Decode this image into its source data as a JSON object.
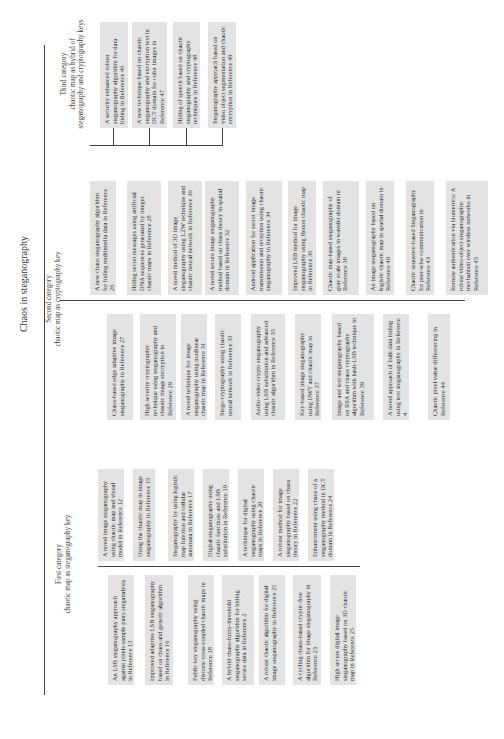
{
  "title": "Chaos in steganography",
  "categories": [
    {
      "label_line1": "First category",
      "label_line2": "chaotic map as steganography key",
      "top_boxes": [
        "A novel image steganography using chaotic map and visual model in Reference 12",
        "Using the chaotic map in image steganography in Reference 15",
        "Steganography by using logistic map function and cellular automata in Reference 17",
        "Digital steganography using chaotic functions and LSB substitution in Reference 19",
        "A technique for digital steganography using chaotic maps in Reference 20",
        "A robust method for image steganography based on chaos theory in Reference 22",
        "Enhancement using chaos of a steganography method in DCT domain in Reference 24"
      ],
      "bottom_boxes": [
        "An LSB steganography approach against pixels sample pairs steganalysis in Reference 13",
        "Improved adaptive LSB steganography based on chaos and genetic algorithm in Reference 16",
        "Public key steganography using discrete cross-coupled chaotic maps in Reference 18",
        "A hybrid chaos-fuzzy-threshold steganography algorithm for hiding secure data in Reference 2",
        "A robust chaotic algorithm for digital image steganography in Reference 21",
        "A cycling chaos-based cryptic-free algorithm for image steganography in Reference 23",
        "High secure digital image steganography based on 3D chaotic map in Reference 25"
      ]
    },
    {
      "label_line1": "Second category",
      "label_line2": "chaotic map as cryptography key",
      "top_boxes": [
        "A new chaos steganography algorithm for hiding multimedia data in Reference 26",
        "Hiding secret messages using artificial DNA sequences generated by integer chaotic maps in Reference 28",
        "A novel method of 3D image steganography using LZW technique and chaotic neural network in Reference 30",
        "A novel secure image steganography method based on chaos theory in spatial domain in Reference 32",
        "Android application for secret image transmission and reception using chaotic steganography in Reference 34",
        "Improved LSB method for image steganography using Henon chaotic map in Reference 36",
        "Chaotic map-based steganography of gray scale images in wavelet domain in Reference 38",
        "An image steganography based on logistic chaotic map in spatial domain in Reference 40",
        "Chaotic sequence-based Steganography for peer-wise communication in Reference 43",
        "Remote authentication via biometrics: A robust video-object steganographic mechanism over wireless networks in Reference 45"
      ],
      "bottom_boxes": [
        "Chaos-based edge adaptive image steganography in Reference 27",
        "High security cryptographic technique using steganography and chaotic image encryption in Reference 29",
        "A novel technique for image steganography using nonlinear chaotic map in Reference 31",
        "Stego-cryptography using chaotic neural network in Reference 33",
        "Audio–video crypto steganography using LSB substitution and advanced chaotic algorithm in Reference 35",
        "Key-based image steganography using DWT and chaotic map in Reference 37",
        "Image and text steganography based on RSA and chaos cryptography algorithm with hash-LSB technique in Reference 39",
        "A novel approach of bulk data hiding using text steganography in Reference 4",
        "Chaotic pixel value differencing in Reference 44"
      ]
    },
    {
      "label_line1": "Third category",
      "label_line2": "chaotic map as hybrid of",
      "label_line3": "steganography and cryptography keys",
      "top_boxes": [
        "A security enhanced robust steganography algorithm for data hiding in Reference 46",
        "A new technique based on chaotic steganography and encryption text in DCT domain for color images in Reference 47",
        "Hiding of speech based on chaotic steganography and cryptography techniques in Reference 48",
        "Steganography approach based on video object segmentation and chaotic encryption in Reference 49"
      ]
    }
  ],
  "colors": {
    "box_fill": "#e3e3e3",
    "line": "#444444",
    "text": "#333333"
  }
}
